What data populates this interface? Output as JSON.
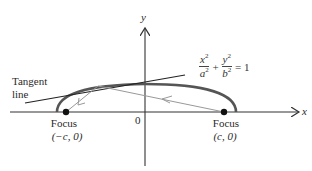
{
  "diagram": {
    "type": "ellipse-reflection",
    "axes": {
      "x_label": "x",
      "y_label": "y",
      "origin_label": "0"
    },
    "equation": {
      "term1_num": "x",
      "term1_den": "a",
      "term2_num": "y",
      "term2_den": "b",
      "exponent": "2",
      "plus": "+",
      "rhs": "= 1"
    },
    "tangent_label": {
      "line1": "Tangent",
      "line2": "line"
    },
    "foci": [
      {
        "label": "Focus",
        "coords": "(−c, 0)"
      },
      {
        "label": "Focus",
        "coords": "(c, 0)"
      }
    ],
    "colors": {
      "axis": "#333333",
      "ellipse": "#555555",
      "tangent": "#222222",
      "rays": "#999999",
      "focus_dot": "#111111"
    }
  }
}
